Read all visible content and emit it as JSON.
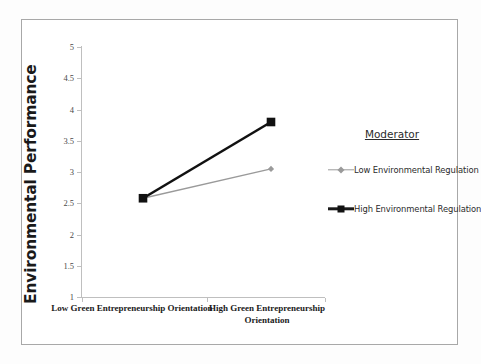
{
  "chart_data": {
    "type": "line",
    "title": "",
    "xlabel": "",
    "ylabel": "Environmental Performance",
    "categories": [
      "Low Green Entrepreneurship Orientation",
      "High Green Entrepreneurship Orientation"
    ],
    "ylim": [
      1,
      5
    ],
    "ytick_labels": [
      "5",
      "4.5",
      "4",
      "3.5",
      "3",
      "2.5",
      "2",
      "1.5",
      "1"
    ],
    "ytick_values": [
      5,
      4.5,
      4,
      3.5,
      3,
      2.5,
      2,
      1.5,
      1
    ],
    "grid": false,
    "legend_position": "right",
    "legend_title": "Moderator",
    "series": [
      {
        "name": "Low Environmental Regulation",
        "values": [
          2.58,
          3.05
        ],
        "color": "#9a9a9a",
        "marker": "diamond"
      },
      {
        "name": "High Environmental Regulation",
        "values": [
          2.58,
          3.8
        ],
        "color": "#111111",
        "marker": "square"
      }
    ]
  },
  "axis": {
    "y_title": "Environmental Performance",
    "x_categories": [
      "Low Green Entrepreneurship Orientation",
      "High Green Entrepreneurship Orientation"
    ],
    "y_ticks": [
      "5",
      "4.5",
      "4",
      "3.5",
      "3",
      "2.5",
      "2",
      "1.5",
      "1"
    ]
  },
  "legend": {
    "title": "Moderator",
    "items": [
      {
        "label": "Low Environmental Regulation"
      },
      {
        "label": "High Environmental Regulation"
      }
    ]
  },
  "colors": {
    "low_series": "#9a9a9a",
    "high_series": "#111111",
    "axis": "#bfbfbf",
    "frame": "#a8a8a8",
    "text": "#1a1a1a"
  }
}
